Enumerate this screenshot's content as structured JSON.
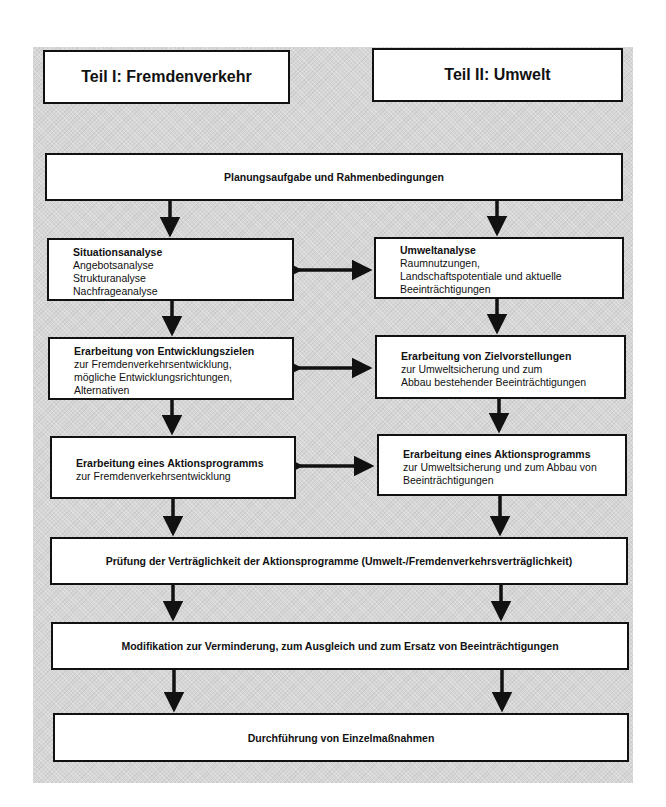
{
  "headers": {
    "left": "Teil I: Fremdenverkehr",
    "right": "Teil II: Umwelt"
  },
  "wide_steps": [
    "Planungsaufgabe und Rahmenbedingungen",
    "Prüfung der Verträglichkeit der Aktionsprogramme (Umwelt-/Fremdenverkehrsverträglichkeit)",
    "Modifikation zur Verminderung, zum Ausgleich und zum Ersatz von Beeinträchtigungen",
    "Durchführung von Einzelmaßnahmen"
  ],
  "left_column": [
    {
      "title": "Situationsanalyse",
      "lines": [
        "Angebotsanalyse",
        "Strukturanalyse",
        "Nachfrageanalyse"
      ]
    },
    {
      "title": "Erarbeitung von Entwicklungszielen",
      "lines": [
        "zur Fremdenverkehrsentwicklung,",
        "mögliche Entwicklungsrichtungen,",
        "Alternativen"
      ]
    },
    {
      "title": "Erarbeitung eines Aktionsprogramms",
      "lines": [
        "zur Fremdenverkehrsentwicklung"
      ]
    }
  ],
  "right_column": [
    {
      "title": "Umweltanalyse",
      "lines": [
        "Raumnutzungen,",
        "Landschaftspotentiale und aktuelle",
        "Beeinträchtigungen"
      ]
    },
    {
      "title": "Erarbeitung von Zielvorstellungen",
      "lines": [
        "zur Umweltsicherung und zum",
        "Abbau bestehender Beeinträchtigungen"
      ]
    },
    {
      "title": "Erarbeitung eines Aktionsprogramms",
      "lines": [
        "zur Umweltsicherung und zum Abbau von",
        "Beeinträchtigungen"
      ]
    }
  ],
  "colors": {
    "background": "#d6d6d6",
    "box": "#ffffff",
    "stroke": "#111111"
  }
}
